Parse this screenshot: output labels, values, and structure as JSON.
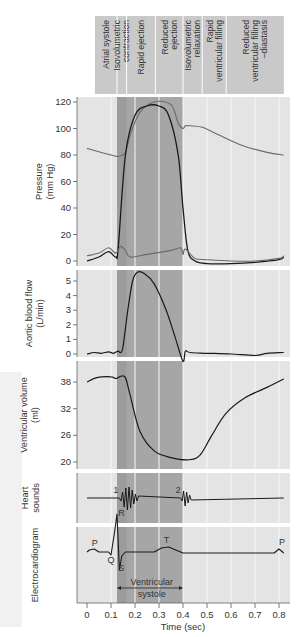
{
  "phases": [
    {
      "label_lines": [
        "Atrial systole"
      ]
    },
    {
      "label_lines": [
        "Isovolumetric",
        "contraction"
      ]
    },
    {
      "label_lines": [
        "Rapid ejection"
      ]
    },
    {
      "label_lines": [
        "Reduced",
        "ejection"
      ]
    },
    {
      "label_lines": [
        "Isovolumetric",
        "relaxation"
      ]
    },
    {
      "label_lines": [
        "Rapid",
        "ventricular filling"
      ]
    },
    {
      "label_lines": [
        "Reduced",
        "ventricular filling",
        "–diastasis"
      ]
    }
  ],
  "panels": {
    "pressure": {
      "ylabel": [
        "Pressure",
        "(mm Hg)"
      ],
      "ticks": [
        "0",
        "20",
        "40",
        "60",
        "80",
        "100",
        "120"
      ]
    },
    "aortic_flow": {
      "ylabel": [
        "Aortic blood flow",
        "(L/min)"
      ],
      "ticks": [
        "0",
        "1",
        "2",
        "3",
        "4",
        "5"
      ]
    },
    "volume": {
      "ylabel": [
        "Ventricular volume",
        "(ml)"
      ],
      "ticks": [
        "20",
        "26",
        "32",
        "38"
      ]
    },
    "heart_sounds": {
      "ylabel": [
        "Heart",
        "sounds"
      ],
      "labels": [
        "1",
        "2"
      ]
    },
    "ecg": {
      "ylabel": [
        "Electrocardiogram"
      ],
      "labels": [
        "P",
        "Q",
        "R",
        "S",
        "T",
        "P"
      ],
      "annotation": [
        "Ventricular",
        "systole"
      ]
    }
  },
  "xaxis": {
    "label": "Time (sec)",
    "ticks": [
      "0",
      "0.1",
      "0.2",
      "0.3",
      "0.4",
      "0.5",
      "0.6",
      "0.7",
      "0.8"
    ]
  },
  "colors": {
    "dark_band": "#a6a6a6",
    "darker_band": "#9c9c9c",
    "light_bg": "#e4e4e4",
    "header_bg": "#c9c9c9",
    "trace": "#1a1a1a",
    "aortic_trace": "#6a6a6a"
  },
  "chart_data": {
    "type": "line",
    "xlabel": "Time (sec)",
    "xlim": [
      0,
      0.8
    ],
    "phase_boundaries_sec": [
      0,
      0.125,
      0.165,
      0.285,
      0.4,
      0.48,
      0.58,
      0.82
    ],
    "series": [
      {
        "name": "Aortic pressure",
        "unit": "mm Hg",
        "ylim": [
          0,
          120
        ],
        "x": [
          0,
          0.1,
          0.13,
          0.16,
          0.18,
          0.22,
          0.28,
          0.35,
          0.38,
          0.4,
          0.41,
          0.43,
          0.48,
          0.55,
          0.65,
          0.75,
          0.82
        ],
        "y": [
          85,
          80,
          79,
          82,
          95,
          112,
          120,
          118,
          104,
          100,
          102,
          102,
          101,
          95,
          87,
          82,
          80
        ]
      },
      {
        "name": "Ventricular pressure",
        "unit": "mm Hg",
        "ylim": [
          0,
          120
        ],
        "x": [
          0,
          0.05,
          0.09,
          0.12,
          0.13,
          0.16,
          0.2,
          0.25,
          0.3,
          0.34,
          0.38,
          0.4,
          0.42,
          0.45,
          0.5,
          0.6,
          0.7,
          0.8,
          0.82
        ],
        "y": [
          0,
          3,
          7,
          3,
          10,
          80,
          110,
          117,
          117,
          110,
          80,
          40,
          8,
          0,
          -2,
          -2,
          -1,
          1,
          3
        ]
      },
      {
        "name": "Atrial pressure",
        "unit": "mm Hg",
        "ylim": [
          0,
          120
        ],
        "x": [
          0,
          0.05,
          0.09,
          0.12,
          0.14,
          0.16,
          0.18,
          0.25,
          0.35,
          0.39,
          0.4,
          0.41,
          0.45,
          0.5,
          0.6,
          0.7,
          0.8,
          0.82
        ],
        "y": [
          4,
          6,
          10,
          6,
          11,
          8,
          3,
          5,
          8,
          10,
          5,
          9,
          2,
          1,
          0,
          0,
          2,
          4
        ]
      },
      {
        "name": "Aortic blood flow",
        "unit": "L/min",
        "ylim": [
          0,
          5
        ],
        "x": [
          0,
          0.03,
          0.06,
          0.09,
          0.11,
          0.13,
          0.14,
          0.15,
          0.17,
          0.19,
          0.21,
          0.24,
          0.28,
          0.33,
          0.37,
          0.4,
          0.41,
          0.43,
          0.5,
          0.6,
          0.7,
          0.75,
          0.82
        ],
        "y": [
          0,
          0.1,
          0.05,
          0.15,
          0.05,
          0.2,
          0.1,
          0.5,
          3.0,
          5.0,
          5.6,
          5.5,
          4.8,
          3.0,
          1.0,
          -0.5,
          0.2,
          0.1,
          0.05,
          0.0,
          -0.1,
          0.05,
          0.1
        ]
      },
      {
        "name": "Ventricular volume",
        "unit": "ml",
        "ylim": [
          20,
          38
        ],
        "x": [
          0,
          0.04,
          0.1,
          0.12,
          0.14,
          0.16,
          0.18,
          0.22,
          0.28,
          0.35,
          0.42,
          0.47,
          0.52,
          0.58,
          0.66,
          0.75,
          0.82
        ],
        "y": [
          38,
          39,
          39.2,
          38.8,
          39.3,
          39,
          35,
          27,
          22.5,
          21,
          20.5,
          21.5,
          26,
          31,
          34.5,
          36.8,
          38.7
        ]
      },
      {
        "name": "Heart sounds",
        "marks": [
          {
            "label": "1",
            "x_sec": 0.15
          },
          {
            "label": "2",
            "x_sec": 0.4
          }
        ]
      },
      {
        "name": "Electrocardiogram",
        "marks": [
          {
            "label": "P",
            "x_sec": 0.02
          },
          {
            "label": "Q",
            "x_sec": 0.1
          },
          {
            "label": "R",
            "x_sec": 0.125
          },
          {
            "label": "S",
            "x_sec": 0.14
          },
          {
            "label": "T",
            "x_sec": 0.33
          },
          {
            "label": "P",
            "x_sec": 0.8
          }
        ]
      }
    ]
  }
}
